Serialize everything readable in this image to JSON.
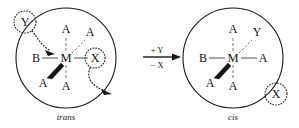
{
  "figure": {
    "background_color": "#ffffff",
    "ink_color": "#1a1a1a"
  },
  "reactant": {
    "name": "trans-complex",
    "isomer_label": "trans",
    "center_atom": "M",
    "ligands": {
      "top": "A",
      "bottom": "A",
      "left": "B",
      "right": "X",
      "upper_right": "A",
      "lower_left": "A"
    },
    "incoming_group": {
      "label": "Y",
      "state": "entering",
      "highlighted": true
    },
    "leaving_group": {
      "label": "X",
      "state": "leaving",
      "highlighted": true
    }
  },
  "reaction_arrow": {
    "name": "reaction-arrow",
    "added_reagent": "+ Y",
    "removed_reagent": "− X",
    "direction": "right"
  },
  "product": {
    "name": "cis-complex",
    "isomer_label": "cis",
    "center_atom": "M",
    "ligands": {
      "top": "A",
      "bottom": "A",
      "left": "B",
      "right": "A",
      "upper_right": "Y",
      "lower_left": "A"
    },
    "expelled_group": {
      "label": "X",
      "state": "expelled",
      "highlighted": true
    }
  }
}
